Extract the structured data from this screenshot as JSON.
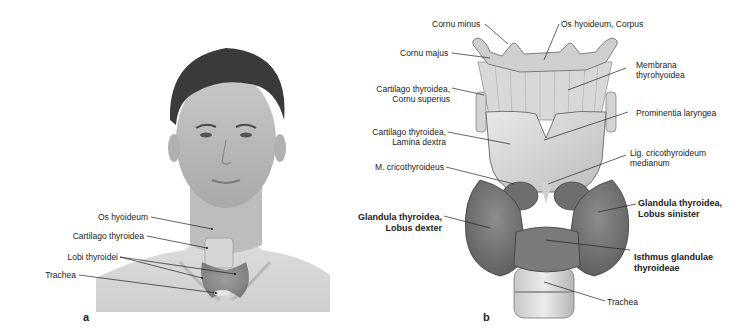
{
  "panel_a": {
    "letter": "a",
    "labels": {
      "os_hyoideum": "Os hyoideum",
      "cartilago_thyroidea": "Cartilago thyroidea",
      "lobi_thyroidei": "Lobi thyroidei",
      "trachea": "Trachea"
    }
  },
  "panel_b": {
    "letter": "b",
    "labels": {
      "cornu_minus": "Cornu minus",
      "os_hyoideum_corpus": "Os hyoideum, Corpus",
      "cornu_majus": "Cornu majus",
      "membrana_1": "Membrana",
      "membrana_2": "thyrohyoidea",
      "cornu_sup_1": "Cartilago thyroidea,",
      "cornu_sup_2": "Cornu superius",
      "prominentia": "Prominentia laryngea",
      "lamina_1": "Cartilago thyroidea,",
      "lamina_2": "Lamina dextra",
      "lig_1": "Lig. cricothyroideum",
      "lig_2": "medianum",
      "m_crico": "M. cricothyroideus",
      "lobus_dexter_1": "Glandula thyroidea,",
      "lobus_dexter_2": "Lobus dexter",
      "lobus_sinister_1": "Glandula thyroidea,",
      "lobus_sinister_2": "Lobus sinister",
      "isthmus_1": "Isthmus glandulae",
      "isthmus_2": "thyroideae",
      "trachea": "Trachea"
    }
  }
}
